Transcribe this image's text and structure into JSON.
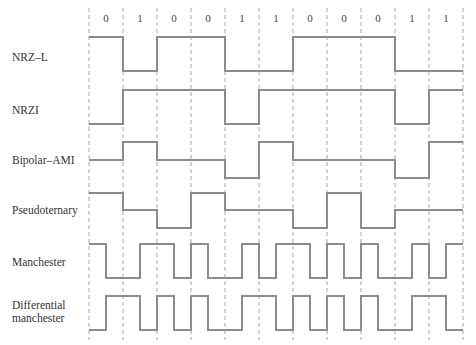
{
  "bits": [
    0,
    1,
    0,
    0,
    1,
    1,
    0,
    0,
    0,
    1,
    1
  ],
  "bit_labels": [
    "0",
    "1",
    "0",
    "0",
    "1",
    "1",
    "0",
    "0",
    "0",
    "1",
    "1"
  ],
  "grid": {
    "x0": 89,
    "bit_width": 34,
    "top": 8,
    "bottom": 340
  },
  "colors": {
    "waveform": "#8c8c8c",
    "grid": "#a8a8a8",
    "text": "#333333"
  },
  "rows": [
    {
      "label": "NRZ–L",
      "encoding": "nrzl",
      "label_y": 51,
      "high": 37,
      "low": 71
    },
    {
      "label": "NRZI",
      "encoding": "nrzi",
      "label_y": 104,
      "high": 90,
      "low": 124
    },
    {
      "label": "Bipolar–AMI",
      "encoding": "ami",
      "label_y": 154,
      "high": 142,
      "zero": 160,
      "low": 178
    },
    {
      "label": "Pseudoternary",
      "encoding": "pseudo",
      "label_y": 204,
      "high": 193,
      "zero": 210,
      "low": 228
    },
    {
      "label": "Manchester",
      "encoding": "manchester",
      "label_y": 256,
      "high": 244,
      "low": 278
    },
    {
      "label": "Differential\nmanchester",
      "label_line1": "Differential",
      "label_line2": "manchester",
      "encoding": "diffman",
      "label_y": 299,
      "high": 296,
      "low": 330
    }
  ]
}
